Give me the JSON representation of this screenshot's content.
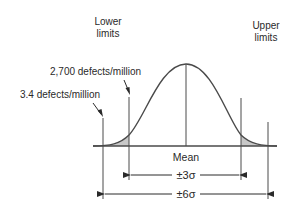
{
  "diagram": {
    "labels": {
      "lower_limits_line1": "Lower",
      "lower_limits_line2": "limits",
      "upper_limits_line1": "Upper",
      "upper_limits_line2": "limits",
      "defects_3sigma": "2,700 defects/million",
      "defects_6sigma": "3.4 defects/million",
      "mean": "Mean",
      "three_sigma": "±3σ",
      "six_sigma": "±6σ"
    },
    "colors": {
      "line": "#4a4a4a",
      "tail_fill": "#c8c8c8",
      "text": "#2a2a2a",
      "background": "#ffffff"
    }
  }
}
